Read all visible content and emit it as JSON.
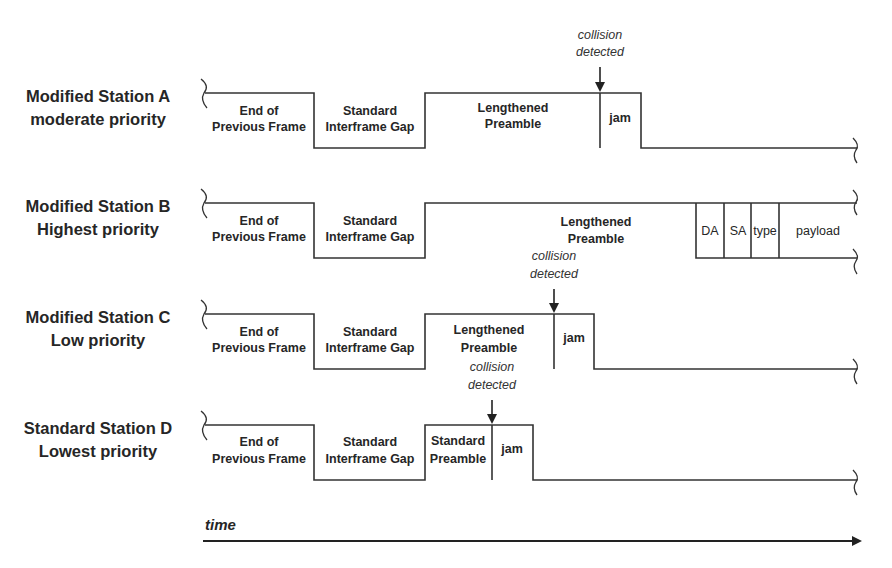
{
  "diagram": {
    "time_axis_label": "time",
    "stations": [
      {
        "name": "Modified Station A",
        "priority": "moderate priority",
        "segments": {
          "end_prev_frame": [
            "End of",
            "Previous Frame"
          ],
          "interframe_gap": [
            "Standard",
            "Interframe Gap"
          ],
          "preamble": [
            "Lengthened",
            "Preamble"
          ],
          "jam": "jam"
        },
        "collision_note": [
          "collision",
          "detected"
        ]
      },
      {
        "name": "Modified Station B",
        "priority": "Highest priority",
        "segments": {
          "end_prev_frame": [
            "End of",
            "Previous Frame"
          ],
          "interframe_gap": [
            "Standard",
            "Interframe Gap"
          ],
          "preamble": [
            "Lengthened",
            "Preamble"
          ],
          "frame_fields": [
            "DA",
            "SA",
            "type",
            "payload"
          ]
        }
      },
      {
        "name": "Modified Station C",
        "priority": "Low priority",
        "segments": {
          "end_prev_frame": [
            "End of",
            "Previous Frame"
          ],
          "interframe_gap": [
            "Standard",
            "Interframe Gap"
          ],
          "preamble": [
            "Lengthened",
            "Preamble"
          ],
          "jam": "jam"
        },
        "collision_note": [
          "collision",
          "detected"
        ]
      },
      {
        "name": "Standard Station D",
        "priority": "Lowest priority",
        "segments": {
          "end_prev_frame": [
            "End of",
            "Previous Frame"
          ],
          "interframe_gap": [
            "Standard",
            "Interframe Gap"
          ],
          "preamble": [
            "Standard",
            "Preamble"
          ],
          "jam": "jam"
        },
        "collision_note": [
          "collision",
          "detected"
        ]
      }
    ]
  }
}
